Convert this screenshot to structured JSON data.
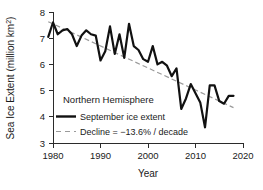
{
  "chart_data": {
    "type": "line",
    "title": "",
    "subtitle": "",
    "annotation": "Northern Hemisphere",
    "xlabel": "Year",
    "ylabel": "Sea Ice Extent (million km²)",
    "ylabel_main": "Sea Ice Extent (million km",
    "ylabel_sup": "2",
    "ylabel_close": ")",
    "xlim": [
      1979,
      2020
    ],
    "ylim": [
      3,
      8
    ],
    "xticks": [
      1980,
      1990,
      2000,
      2010,
      2020
    ],
    "xtick_labels": [
      "1980",
      "1990",
      "2000",
      "2010",
      "2020"
    ],
    "yticks": [
      3,
      4,
      5,
      6,
      7,
      8
    ],
    "ytick_labels": [
      "3",
      "4",
      "5",
      "6",
      "7",
      "8"
    ],
    "grid": false,
    "legend_position": "lower-left-inside",
    "legend": [
      {
        "label": "September ice extent",
        "style": "solid",
        "color": "#111111"
      },
      {
        "label": "Decline = −13.6% / decade",
        "style": "dashed",
        "color": "#9a9a9a"
      }
    ],
    "series": [
      {
        "name": "September ice extent",
        "style": "solid",
        "color": "#111111",
        "x": [
          1979,
          1980,
          1981,
          1982,
          1983,
          1984,
          1985,
          1986,
          1987,
          1988,
          1989,
          1990,
          1991,
          1992,
          1993,
          1994,
          1995,
          1996,
          1997,
          1998,
          1999,
          2000,
          2001,
          2002,
          2003,
          2004,
          2005,
          2006,
          2007,
          2008,
          2009,
          2010,
          2011,
          2012,
          2013,
          2014,
          2015,
          2016,
          2017,
          2018
        ],
        "values": [
          7.05,
          7.6,
          7.15,
          7.3,
          7.35,
          7.15,
          6.7,
          7.1,
          7.3,
          7.15,
          7.1,
          6.15,
          6.5,
          7.45,
          6.4,
          7.15,
          6.25,
          7.55,
          6.7,
          6.55,
          6.2,
          6.1,
          6.7,
          6.0,
          6.1,
          5.95,
          5.55,
          5.85,
          4.3,
          4.7,
          5.25,
          4.9,
          4.55,
          3.6,
          5.2,
          5.2,
          4.6,
          4.5,
          4.8,
          4.8
        ]
      },
      {
        "name": "Decline = −13.6% / decade",
        "style": "dashed",
        "color": "#9a9a9a",
        "x": [
          1979,
          2018
        ],
        "values": [
          7.63,
          4.35
        ],
        "slope_percent_per_decade": -13.6
      }
    ]
  }
}
